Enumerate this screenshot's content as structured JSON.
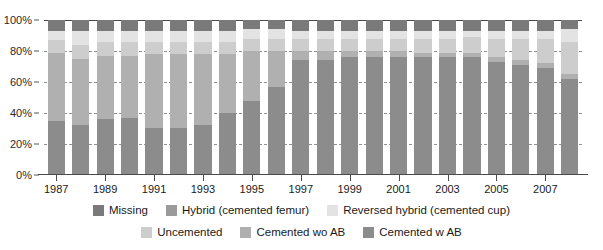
{
  "chart_data": {
    "type": "bar",
    "subtype": "stacked-percentage-column",
    "title": "",
    "subtitle": "",
    "xlabel": "",
    "ylabel": "",
    "ylim": [
      0,
      100
    ],
    "y_unit": "%",
    "grid": "horizontal-dashed",
    "legend_position": "bottom",
    "y_ticks": [
      "0%",
      "20%",
      "40%",
      "60%",
      "80%",
      "100%"
    ],
    "y_tick_values": [
      0,
      20,
      40,
      60,
      80,
      100
    ],
    "categories": [
      "1987",
      "1988",
      "1989",
      "1990",
      "1991",
      "1992",
      "1993",
      "1994",
      "1995",
      "1996",
      "1997",
      "1998",
      "1999",
      "2000",
      "2001",
      "2002",
      "2003",
      "2004",
      "2005",
      "2006",
      "2007",
      "2008"
    ],
    "x_tick_labels": [
      "1987",
      "1989",
      "1991",
      "1993",
      "1995",
      "1997",
      "1999",
      "2001",
      "2003",
      "2005",
      "2007"
    ],
    "series": [
      {
        "name": "Cemented w AB",
        "color": "#8c8c8c",
        "values": [
          35,
          32,
          36,
          37,
          30,
          30,
          32,
          40,
          48,
          57,
          74,
          74,
          76,
          76,
          76,
          76,
          76,
          76,
          73,
          71,
          69,
          62
        ]
      },
      {
        "name": "Cemented wo AB",
        "color": "#b0b0b0",
        "values": [
          44,
          43,
          41,
          40,
          48,
          48,
          46,
          38,
          32,
          23,
          6,
          6,
          4,
          4,
          4,
          3,
          3,
          3,
          3,
          3,
          3,
          3
        ]
      },
      {
        "name": "Uncemented",
        "color": "#cdcdcd",
        "values": [
          8,
          9,
          9,
          9,
          8,
          8,
          8,
          8,
          8,
          8,
          8,
          8,
          8,
          8,
          8,
          9,
          9,
          10,
          12,
          14,
          16,
          21
        ]
      },
      {
        "name": "Reversed hybrid (cemented cup)",
        "color": "#e3e3e3",
        "values": [
          6,
          9,
          7,
          7,
          7,
          7,
          7,
          7,
          6,
          6,
          5,
          5,
          5,
          5,
          5,
          5,
          5,
          4,
          5,
          5,
          5,
          8
        ]
      },
      {
        "name": "Hybrid (cemented femur)",
        "color": "#9a9a9a",
        "values": [
          0,
          0,
          0,
          0,
          0,
          0,
          0,
          0,
          0,
          0,
          0,
          0,
          0,
          0,
          0,
          0,
          0,
          0,
          0,
          0,
          0,
          0
        ]
      },
      {
        "name": "Missing",
        "color": "#7a7a7a",
        "values": [
          7,
          7,
          7,
          7,
          7,
          7,
          7,
          7,
          6,
          6,
          7,
          7,
          7,
          7,
          7,
          7,
          7,
          7,
          7,
          7,
          7,
          6
        ]
      }
    ],
    "stack_order_bottom_to_top": [
      "Cemented w AB",
      "Cemented wo AB",
      "Uncemented",
      "Reversed hybrid (cemented cup)",
      "Hybrid (cemented femur)",
      "Missing"
    ]
  },
  "legend": {
    "rows": [
      [
        {
          "label": "Missing",
          "color": "#7a7a7a"
        },
        {
          "label": "Hybrid (cemented femur)",
          "color": "#9a9a9a"
        },
        {
          "label": "Reversed hybrid (cemented cup)",
          "color": "#e3e3e3"
        }
      ],
      [
        {
          "label": "Uncemented",
          "color": "#cdcdcd"
        },
        {
          "label": "Cemented wo AB",
          "color": "#b0b0b0"
        },
        {
          "label": "Cemented w AB",
          "color": "#8c8c8c"
        }
      ]
    ]
  },
  "colors": {
    "background": "#ffffff",
    "axis": "#4a4a4a",
    "gridline": "#7d7d7d",
    "text": "#1a1a1a"
  }
}
